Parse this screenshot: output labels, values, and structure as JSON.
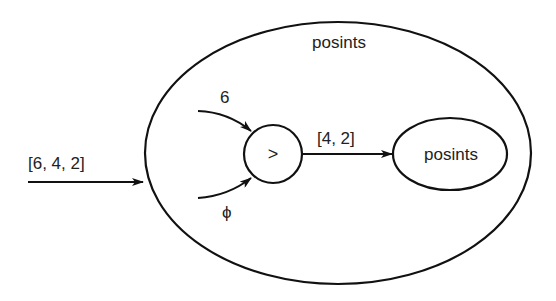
{
  "diagram": {
    "outer_node": {
      "label": "posints"
    },
    "input_edge": {
      "label": "[6, 4, 2]"
    },
    "comparator_node": {
      "label": ">"
    },
    "upper_input": {
      "label": "6"
    },
    "lower_input": {
      "label": "ϕ"
    },
    "output_edge": {
      "label": "[4, 2]"
    },
    "inner_node": {
      "label": "posints"
    }
  },
  "colors": {
    "stroke": "#111111",
    "text": "#222222",
    "background": "#ffffff"
  }
}
